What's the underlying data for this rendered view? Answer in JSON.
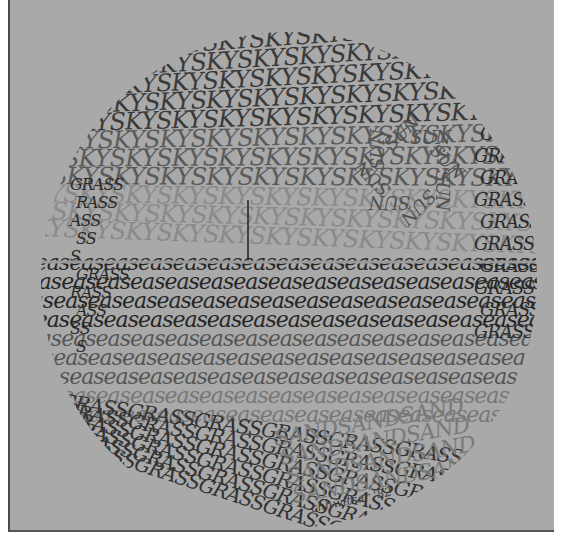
{
  "artwork": {
    "type": "calligram",
    "shape": "circle",
    "words": {
      "sky": "SKY",
      "sea": "sea",
      "grass": "GRASS",
      "sand": "SAND",
      "sun": "SUN"
    },
    "regions": [
      {
        "name": "sky",
        "word": "SKY",
        "color": "#3d3d3d"
      },
      {
        "name": "sun",
        "word": "SUN",
        "color": "#555555"
      },
      {
        "name": "sea",
        "word": "sea",
        "color": "#2e2e2e"
      },
      {
        "name": "grass",
        "word": "GRASS",
        "color": "#333333"
      },
      {
        "name": "sand",
        "word": "SAND",
        "color": "#777777"
      }
    ],
    "signature": "chhwitsar '82",
    "colors": {
      "background": "#a9a9a9",
      "border": "#4a4a4a",
      "ink_dark": "#2e2e2e",
      "ink_light": "#7a7a7a"
    }
  }
}
